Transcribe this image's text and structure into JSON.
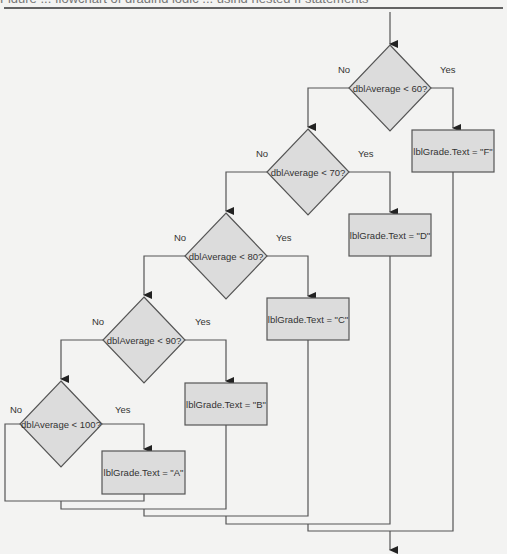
{
  "figure": {
    "caption_partial": "Figure  ...  flowchart of grading logic  ...  using nested If statements",
    "top_rule": {
      "y": 8,
      "color": "#333333"
    }
  },
  "colors": {
    "background": "#f3f3f2",
    "shape_fill": "#dcdcdc",
    "stroke": "#555555",
    "text": "#333333"
  },
  "entry": {
    "x": 390,
    "y1": 12,
    "y2": 44
  },
  "exit": {
    "x": 390,
    "y1": 531,
    "y2": 550
  },
  "decisions": [
    {
      "id": "d60",
      "label": "dblAverage < 60?",
      "cx": 390,
      "cy": 88,
      "hw": 41,
      "hh": 43
    },
    {
      "id": "d70",
      "label": "dblAverage < 70?",
      "cx": 308,
      "cy": 172,
      "hw": 41,
      "hh": 43
    },
    {
      "id": "d80",
      "label": "dblAverage < 80?",
      "cx": 226,
      "cy": 256,
      "hw": 41,
      "hh": 43
    },
    {
      "id": "d90",
      "label": "dblAverage < 90?",
      "cx": 144,
      "cy": 340,
      "hw": 41,
      "hh": 43
    },
    {
      "id": "d100",
      "label": "dblAverage < 100?",
      "cx": 61,
      "cy": 424,
      "hw": 41,
      "hh": 43
    }
  ],
  "processes": [
    {
      "id": "pF",
      "label": "lblGrade.Text = \"F\"",
      "x": 412,
      "y": 130,
      "w": 82,
      "h": 42
    },
    {
      "id": "pD",
      "label": "lblGrade.Text = \"D\"",
      "x": 349,
      "y": 214,
      "w": 82,
      "h": 42
    },
    {
      "id": "pC",
      "label": "lblGrade.Text = \"C\"",
      "x": 267,
      "y": 298,
      "w": 82,
      "h": 42
    },
    {
      "id": "pB",
      "label": "lblGrade.Text = \"B\"",
      "x": 185,
      "y": 383,
      "w": 82,
      "h": 42
    },
    {
      "id": "pA",
      "label": "lblGrade.Text = \"A\"",
      "x": 102,
      "y": 451,
      "w": 83,
      "h": 43
    }
  ],
  "branch_labels": [
    {
      "text": "No",
      "x": 338,
      "y": 73
    },
    {
      "text": "Yes",
      "x": 440,
      "y": 73
    },
    {
      "text": "No",
      "x": 256,
      "y": 157
    },
    {
      "text": "Yes",
      "x": 358,
      "y": 157
    },
    {
      "text": "No",
      "x": 174,
      "y": 241
    },
    {
      "text": "Yes",
      "x": 276,
      "y": 241
    },
    {
      "text": "No",
      "x": 92,
      "y": 325
    },
    {
      "text": "Yes",
      "x": 195,
      "y": 325
    },
    {
      "text": "No",
      "x": 10,
      "y": 413
    },
    {
      "text": "Yes",
      "x": 115,
      "y": 413
    }
  ],
  "connectors": [
    {
      "points": "431,88 453,88 453,128",
      "arrow": true
    },
    {
      "points": "349,88 308,88 308,127",
      "arrow": true
    },
    {
      "points": "349,172 390,172 390,212",
      "arrow": true
    },
    {
      "points": "267,172 226,172 226,211",
      "arrow": true
    },
    {
      "points": "267,256 308,256 308,296",
      "arrow": true
    },
    {
      "points": "185,256 144,256 144,295",
      "arrow": true
    },
    {
      "points": "185,340 226,340 226,381",
      "arrow": true
    },
    {
      "points": "103,340 61,340 61,379",
      "arrow": true
    },
    {
      "points": "102,424 144,424 144,449",
      "arrow": true
    },
    {
      "points": "20,424 5,424 5,501 144,501 144,494",
      "arrow": false
    },
    {
      "points": "61,501 61,509 226,509 226,425",
      "arrow": false
    },
    {
      "points": "144,509 144,516 308,516 308,340",
      "arrow": false
    },
    {
      "points": "226,516 226,524 390,524 390,256",
      "arrow": false
    },
    {
      "points": "308,524 308,531 453,531 453,172",
      "arrow": false
    }
  ]
}
